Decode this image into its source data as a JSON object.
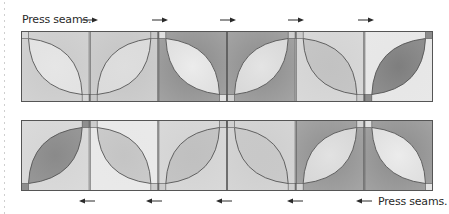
{
  "diagram": {
    "top_row": {
      "label": "Press seams.",
      "label_position": "left",
      "arrow_direction": "right",
      "arrow_count": 6,
      "blocks": [
        {
          "petal": "tl-br",
          "background": "#c9c9c9",
          "petal_fill": "#e6e6e6",
          "corner": "#d6d6d6"
        },
        {
          "petal": "bl-tr",
          "background": "#c4c4c4",
          "petal_fill": "#dedede",
          "corner": "#c8c8c8"
        },
        {
          "petal": "tl-br",
          "background": "#8a8a8a",
          "petal_fill": "#ececec",
          "corner": "#e0e0e0"
        },
        {
          "petal": "bl-tr",
          "background": "#8c8c8c",
          "petal_fill": "#e4e4e4",
          "corner": "#cfcfcf"
        },
        {
          "petal": "tl-br",
          "background": "#d2d2d2",
          "petal_fill": "#c2c2c2",
          "corner": "#cccccc"
        },
        {
          "petal": "bl-tr",
          "background": "#e6e6e6",
          "petal_fill": "#7e7e7e",
          "corner": "#8c8c8c"
        }
      ]
    },
    "bottom_row": {
      "label": "Press seams.",
      "label_position": "right",
      "arrow_direction": "left",
      "arrow_count": 5,
      "blocks": [
        {
          "petal": "bl-tr",
          "background": "#d4d4d4",
          "petal_fill": "#8a8a8a",
          "corner": "#8e8e8e"
        },
        {
          "petal": "tl-br",
          "background": "#e8e8e8",
          "petal_fill": "#c4c4c4",
          "corner": "#cccccc"
        },
        {
          "petal": "bl-tr",
          "background": "#d2d2d2",
          "petal_fill": "#c0c0c0",
          "corner": "#cccccc"
        },
        {
          "petal": "tl-br",
          "background": "#cdcdcd",
          "petal_fill": "#c8c8c8",
          "corner": "#d0d0d0"
        },
        {
          "petal": "bl-tr",
          "background": "#8e8e8e",
          "petal_fill": "#e2e2e2",
          "corner": "#d4d4d4"
        },
        {
          "petal": "tl-br",
          "background": "#8a8a8a",
          "petal_fill": "#ececec",
          "corner": "#e2e2e2"
        }
      ]
    },
    "colors": {
      "outline": "#555555",
      "text": "#2a2a2a",
      "arrow": "#2a2a2a"
    }
  }
}
